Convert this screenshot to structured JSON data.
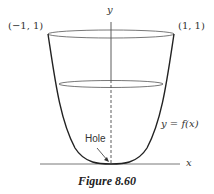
{
  "figure": {
    "caption": "Figure 8.60",
    "labels": {
      "y_axis": "y",
      "x_axis": "x",
      "left_point": "(−1, 1)",
      "right_point": "(1, 1)",
      "curve": "y = f(x)",
      "hole": "Hole"
    }
  }
}
